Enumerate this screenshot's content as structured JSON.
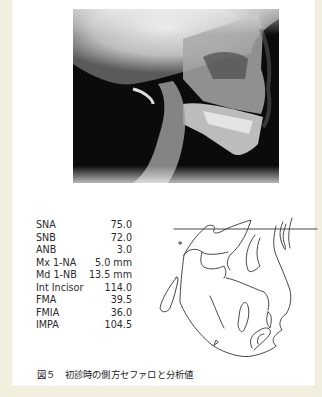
{
  "figure": {
    "image": {
      "type": "lateral-cephalometric-radiograph",
      "description": "Initial lateral cephalogram (x-ray)"
    },
    "analysis_table": {
      "rows": [
        {
          "label": "SNA",
          "value": "75.0"
        },
        {
          "label": "SNB",
          "value": "72.0"
        },
        {
          "label": "ANB",
          "value": "3.0"
        },
        {
          "label": "Mx 1-NA",
          "value": "5.0 mm"
        },
        {
          "label": "Md 1-NB",
          "value": "13.5 mm"
        },
        {
          "label": "Int Incisor",
          "value": "114.0"
        },
        {
          "label": "FMA",
          "value": "39.5"
        },
        {
          "label": "FMIA",
          "value": "36.0"
        },
        {
          "label": "IMPA",
          "value": "104.5"
        }
      ]
    },
    "tracing": {
      "type": "cephalometric-tracing",
      "description": "Line tracing of the cephalogram with S-N reference line"
    },
    "caption": "図５　初診時の側方セファロと分析値"
  },
  "colors": {
    "background": "#f2efdf",
    "panel": "#ffffff",
    "text": "#2b2b2b",
    "tracing_line": "#333333"
  }
}
